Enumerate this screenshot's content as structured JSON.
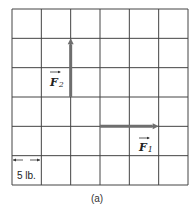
{
  "diagram": {
    "grid": {
      "rows": 6,
      "cols": 6
    },
    "vectors": [
      {
        "id": "F2",
        "name": "F",
        "subscript": "2",
        "start_cell": [
          2,
          3
        ],
        "end_cell": [
          2,
          1
        ],
        "direction": "up",
        "magnitude_cells": 2
      },
      {
        "id": "F1",
        "name": "F",
        "subscript": "1",
        "start_cell": [
          3,
          4
        ],
        "end_cell": [
          5,
          4
        ],
        "direction": "right",
        "magnitude_cells": 2
      }
    ],
    "scale_label": "5 lb.",
    "caption": "(a)",
    "colors": {
      "grid": "#444444",
      "vector": "#6e6e6e",
      "text": "#222222"
    }
  }
}
